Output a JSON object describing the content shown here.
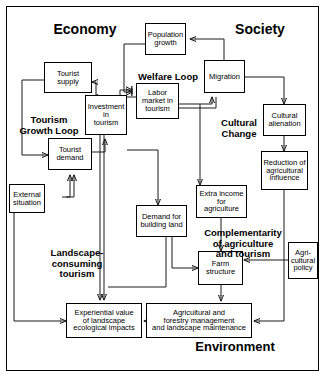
{
  "diagram": {
    "background_color": "#d0d0d0",
    "box_fill": "#ffffff",
    "line_color": "#1a1a1a"
  },
  "domains": [
    {
      "id": "economy",
      "label": "Economy"
    },
    {
      "id": "society",
      "label": "Society"
    },
    {
      "id": "environment",
      "label": "Environment"
    }
  ],
  "loops": [
    {
      "id": "welfare-loop",
      "label": "Welfare Loop"
    },
    {
      "id": "tourism-growth-loop",
      "label": "Tourism\nGrowth Loop"
    },
    {
      "id": "cultural-change",
      "label": "Cultural\nChange"
    },
    {
      "id": "landscape-consuming",
      "label": "Landscape-\nconsuming\ntourism"
    },
    {
      "id": "complementarity",
      "label": "Complementarity\nof agriculture\nand tourism"
    }
  ],
  "nodes": [
    {
      "id": "population-growth",
      "label": "Population\ngrowth"
    },
    {
      "id": "migration",
      "label": "Migration"
    },
    {
      "id": "tourist-supply",
      "label": "Tourist\nsupply"
    },
    {
      "id": "investment-in-tourism",
      "label": "Investment\nin\ntourism"
    },
    {
      "id": "labor-market-in-tourism",
      "label": "Labor\nmarket in\ntourism"
    },
    {
      "id": "cultural-alienation",
      "label": "Cultural\nalienation"
    },
    {
      "id": "tourist-demand",
      "label": "Tourist\ndemand"
    },
    {
      "id": "reduction-agri-influence",
      "label": "Reduction of\nagricultural\ninfluence"
    },
    {
      "id": "external-situation",
      "label": "External\nsituation"
    },
    {
      "id": "extra-income-agriculture",
      "label": "Extra income\nfor\nagriculture"
    },
    {
      "id": "demand-building-land",
      "label": "Demand for\nbuilding land"
    },
    {
      "id": "agricultural-policy",
      "label": "Agri-\ncultural\npolicy"
    },
    {
      "id": "farm-structure",
      "label": "Farm\nstructure"
    },
    {
      "id": "experiential-value",
      "label": "Experiential value\nof landscape\necological impacts"
    },
    {
      "id": "agri-forestry-management",
      "label": "Agricultural and\nforestry management\nand landscape maintenance"
    }
  ]
}
